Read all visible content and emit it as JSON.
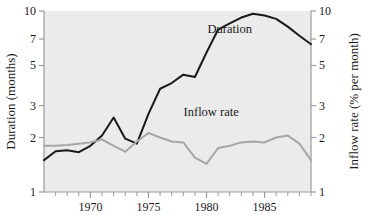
{
  "figure": {
    "background": "#ffffff",
    "plot_background": "#ebebeb",
    "axis_color": "#9a9a9a",
    "caption_fragment": ""
  },
  "chart_data": {
    "type": "line",
    "title": "",
    "subtitle": "",
    "xlabel": "",
    "ylabel": "Duration (months)",
    "y2label": "Inflow rate (% per month)",
    "xlim": [
      1966,
      1989
    ],
    "ylim": [
      1,
      10
    ],
    "yscale": "log",
    "y2lim": [
      1,
      10
    ],
    "y2scale": "log",
    "grid": false,
    "legend_position": "inline-annotations",
    "xticks": [
      1970,
      1975,
      1980,
      1985
    ],
    "xtick_labels": [
      "1970",
      "1975",
      "1980",
      "1985"
    ],
    "xminor_ticks": [
      1967,
      1968,
      1969,
      1971,
      1972,
      1973,
      1974,
      1976,
      1977,
      1978,
      1979,
      1981,
      1982,
      1983,
      1984,
      1986,
      1987,
      1988,
      1989
    ],
    "yticks": [
      1,
      2,
      3,
      5,
      7,
      10
    ],
    "ytick_labels": [
      "1",
      "2",
      "3",
      "5",
      "7",
      "10"
    ],
    "y2ticks": [
      1,
      2,
      3,
      5,
      7,
      10
    ],
    "y2tick_labels": [
      "1",
      "2",
      "3",
      "5",
      "7",
      "10"
    ],
    "x": [
      1966,
      1967,
      1968,
      1969,
      1970,
      1971,
      1972,
      1973,
      1974,
      1975,
      1976,
      1977,
      1978,
      1979,
      1980,
      1981,
      1982,
      1983,
      1984,
      1985,
      1986,
      1987,
      1988,
      1989
    ],
    "series": [
      {
        "name": "Duration",
        "axis": "left",
        "color": "#1a1a1a",
        "width": 2.0,
        "label_x": 1982.0,
        "label_y": 7.6,
        "values": [
          1.5,
          1.68,
          1.7,
          1.66,
          1.8,
          2.05,
          2.58,
          1.97,
          1.85,
          2.7,
          3.72,
          4.0,
          4.45,
          4.32,
          5.9,
          7.9,
          8.55,
          9.2,
          9.65,
          9.45,
          9.05,
          8.2,
          7.3,
          6.55
        ]
      },
      {
        "name": "Inflow rate",
        "axis": "right",
        "color": "#a6a6a6",
        "width": 2.0,
        "label_x": 1980.4,
        "label_y": 2.62,
        "values": [
          1.8,
          1.8,
          1.82,
          1.85,
          1.88,
          1.95,
          1.8,
          1.67,
          1.9,
          2.12,
          2.0,
          1.9,
          1.88,
          1.55,
          1.43,
          1.75,
          1.8,
          1.88,
          1.9,
          1.88,
          2.0,
          2.05,
          1.85,
          1.5
        ]
      }
    ],
    "annotations": [
      {
        "text": "Duration",
        "x": 1982.0,
        "y": 7.6
      },
      {
        "text": "Inflow rate",
        "x": 1980.4,
        "y": 2.62
      }
    ]
  }
}
